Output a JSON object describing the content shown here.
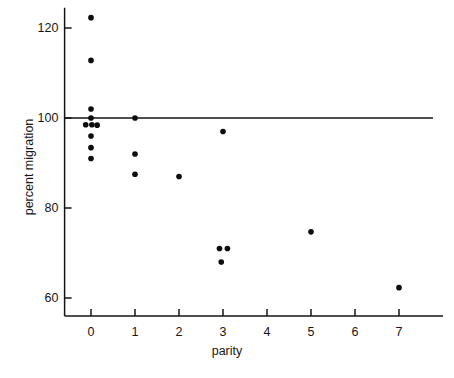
{
  "chart_data": {
    "type": "scatter",
    "title": "",
    "xlabel": "parity",
    "ylabel": "percent migration",
    "xlim": [
      -0.6,
      8.0
    ],
    "ylim": [
      56.0,
      124.5
    ],
    "grid": false,
    "legend": "none",
    "xticks": [
      0,
      1,
      2,
      3,
      4,
      5,
      6,
      7
    ],
    "xtick_labels": [
      "0",
      "1",
      "2",
      "3",
      "4",
      "5",
      "6",
      "7"
    ],
    "yticks": [
      60,
      80,
      100,
      120
    ],
    "ytick_labels": [
      "60",
      "80",
      "100",
      "120"
    ],
    "reference_line": {
      "orientation": "horizontal",
      "y": 100,
      "label": "",
      "color": "#141414"
    },
    "marker": {
      "shape": "circle",
      "color": "#0d0d0d",
      "size": 4.1
    },
    "points": [
      {
        "x": 0,
        "y": 122.3
      },
      {
        "x": 0,
        "y": 112.8
      },
      {
        "x": 0,
        "y": 102.0
      },
      {
        "x": 0,
        "y": 100.0
      },
      {
        "x": -0.12,
        "y": 98.5
      },
      {
        "x": 0.02,
        "y": 98.5
      },
      {
        "x": 0.14,
        "y": 98.4
      },
      {
        "x": 0,
        "y": 96.0
      },
      {
        "x": 0,
        "y": 93.4
      },
      {
        "x": 0,
        "y": 91.0
      },
      {
        "x": 1,
        "y": 100.0
      },
      {
        "x": 1,
        "y": 92.0
      },
      {
        "x": 1,
        "y": 87.5
      },
      {
        "x": 2,
        "y": 87.0
      },
      {
        "x": 3,
        "y": 97.0
      },
      {
        "x": 2.92,
        "y": 71.0
      },
      {
        "x": 3.1,
        "y": 71.0
      },
      {
        "x": 2.96,
        "y": 68.0
      },
      {
        "x": 5,
        "y": 74.7
      },
      {
        "x": 7,
        "y": 62.3
      }
    ]
  },
  "axes": {
    "x_axis_color": "#141414",
    "y_axis_color": "#141414"
  }
}
